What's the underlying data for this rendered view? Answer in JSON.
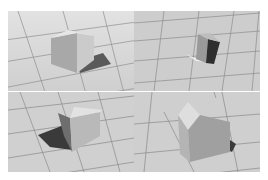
{
  "figure": {
    "layout": "2x2 grid of rendered views",
    "panels": [
      {
        "position": "top-left",
        "subject": "box-house",
        "view": "front-left, shadow cast to right"
      },
      {
        "position": "top-right",
        "subject": "box-house",
        "view": "distant top-down, dark right face"
      },
      {
        "position": "bottom-left",
        "subject": "box-house",
        "view": "rear, shadow cast to left"
      },
      {
        "position": "bottom-right",
        "subject": "pitched-roof house",
        "view": "close-up, gable end"
      }
    ],
    "colors": {
      "floor": "#d2d2d2",
      "grid_line": "#8a8a8a",
      "lit_face": "#e4e4e4",
      "mid_face": "#a6a6a6",
      "dark_face": "#3c3c3c",
      "shadow": "#5a5a5a"
    }
  }
}
